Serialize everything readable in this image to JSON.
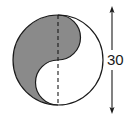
{
  "figure": {
    "name": "yin-yang-circle-diagram",
    "type": "geometry-diagram",
    "background_color": "#ffffff",
    "circle": {
      "center_x": 58,
      "center_y": 60,
      "radius": 45,
      "diameter_value": "30",
      "outline_color": "#1a1a1a",
      "outline_width": 1.2
    },
    "regions": [
      {
        "name": "shaded-region",
        "label": "",
        "fill_color": "#8a8a8a"
      },
      {
        "name": "unshaded-region",
        "label": "",
        "fill_color": "#ffffff"
      }
    ],
    "center_line": {
      "name": "vertical-center-line",
      "style": "dashed",
      "color": "#1a1a1a",
      "dash_pattern": "4 3"
    },
    "dimension": {
      "name": "diameter-dimension",
      "label": "30",
      "orientation": "vertical",
      "x": 112,
      "y_top": 8,
      "y_bottom": 112,
      "arrow_color": "#1a1a1a",
      "text_x": 118,
      "text_y": 65
    }
  }
}
